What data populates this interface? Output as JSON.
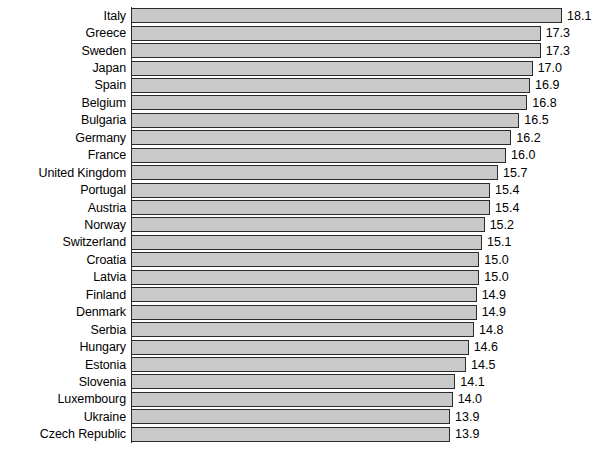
{
  "chart_data": {
    "type": "bar",
    "orientation": "horizontal",
    "title": "",
    "subtitle": "",
    "xlabel": "",
    "ylabel": "",
    "xlim": [
      0,
      18.1
    ],
    "grid": false,
    "legend": null,
    "value_labels_shown": true,
    "value_label_format": "one-decimal",
    "bar_fill_color": "#c9c9c9",
    "bar_border_color": "#2b2b2b",
    "background_color": "#ffffff",
    "text_color": "#000000",
    "sort_order": "descending",
    "categories": [
      "Italy",
      "Greece",
      "Sweden",
      "Japan",
      "Spain",
      "Belgium",
      "Bulgaria",
      "Germany",
      "France",
      "United Kingdom",
      "Portugal",
      "Austria",
      "Norway",
      "Switzerland",
      "Croatia",
      "Latvia",
      "Finland",
      "Denmark",
      "Serbia",
      "Hungary",
      "Estonia",
      "Slovenia",
      "Luxembourg",
      "Ukraine",
      "Czech Republic"
    ],
    "values": [
      18.1,
      17.3,
      17.3,
      17.0,
      16.9,
      16.8,
      16.5,
      16.2,
      16.0,
      15.7,
      15.4,
      15.4,
      15.2,
      15.1,
      15.0,
      15.0,
      14.9,
      14.9,
      14.8,
      14.6,
      14.5,
      14.1,
      14.0,
      13.9,
      13.9
    ],
    "value_labels": [
      "18.1",
      "17.3",
      "17.3",
      "17.0",
      "16.9",
      "16.8",
      "16.5",
      "16.2",
      "16.0",
      "15.7",
      "15.4",
      "15.4",
      "15.2",
      "15.1",
      "15.0",
      "15.0",
      "14.9",
      "14.9",
      "14.8",
      "14.6",
      "14.5",
      "14.1",
      "14.0",
      "13.9",
      "13.9"
    ]
  }
}
